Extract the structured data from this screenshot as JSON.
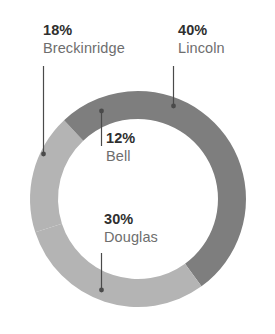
{
  "chart_data": {
    "type": "pie",
    "variant": "donut",
    "title": "",
    "subtitle": "",
    "xlabel": "",
    "ylabel": "",
    "legend_position": "none",
    "grid": false,
    "units": "percent",
    "total": 100,
    "categories": [
      "Lincoln",
      "Douglas",
      "Breckinridge",
      "Bell"
    ],
    "values": [
      40,
      30,
      18,
      12
    ],
    "labels": [
      "40%",
      "30%",
      "18%",
      "12%"
    ],
    "colors": [
      "#7e7e7e",
      "#b4b4b4",
      "#b4b4b4",
      "#7e7e7e"
    ],
    "slices": [
      {
        "name": "Lincoln",
        "value": 40,
        "percent_label": "40%",
        "color": "#7e7e7e",
        "start_angle_deg": 0,
        "end_angle_deg": 144
      },
      {
        "name": "Douglas",
        "value": 30,
        "percent_label": "30%",
        "color": "#b4b4b4",
        "start_angle_deg": 144,
        "end_angle_deg": 252
      },
      {
        "name": "Breckinridge",
        "value": 18,
        "percent_label": "18%",
        "color": "#b4b4b4",
        "start_angle_deg": 252,
        "end_angle_deg": 316.8
      },
      {
        "name": "Bell",
        "value": 12,
        "percent_label": "12%",
        "color": "#7e7e7e",
        "start_angle_deg": 316.8,
        "end_angle_deg": 360
      }
    ]
  },
  "labels": {
    "breckinridge": {
      "percent": "18%",
      "name": "Breckinridge"
    },
    "lincoln": {
      "percent": "40%",
      "name": "Lincoln"
    },
    "bell": {
      "percent": "12%",
      "name": "Bell"
    },
    "douglas": {
      "percent": "30%",
      "name": "Douglas"
    }
  },
  "style": {
    "background": "#ffffff",
    "dark_slice_color": "#7e7e7e",
    "light_slice_color": "#b4b4b4",
    "leader_line_color": "#4a4a4a",
    "percent_text_color": "#2f2f2f",
    "name_text_color": "#6e6e6e"
  }
}
